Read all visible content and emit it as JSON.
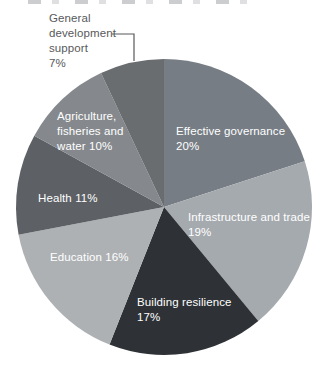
{
  "chart_data": {
    "type": "pie",
    "title": "",
    "legend_position": "none",
    "label_style": "labels inside slices except 'General development support' which sits outside top-left with an elbow leader line",
    "start_angle_deg_from_12_oclock": 0,
    "direction": "clockwise",
    "categories": [
      "Effective governance",
      "Infrastructure and trade",
      "Building resilience",
      "Education",
      "Health",
      "Agriculture, fisheries and water",
      "General development support"
    ],
    "values": [
      20,
      19,
      17,
      16,
      11,
      10,
      7
    ],
    "slices": [
      {
        "key": "effective-governance",
        "label": "Effective governance",
        "value": 20,
        "display": "Effective governance\n20%",
        "color": "#767d84",
        "text_color": "#ffffff"
      },
      {
        "key": "infrastructure-and-trade",
        "label": "Infrastructure and trade",
        "value": 19,
        "display": "Infrastructure and trade\n19%",
        "color": "#a5aaae",
        "text_color": "#ffffff"
      },
      {
        "key": "building-resilience",
        "label": "Building resilience",
        "value": 17,
        "display": "Building resilience\n17%",
        "color": "#2e3236",
        "text_color": "#ffffff"
      },
      {
        "key": "education",
        "label": "Education",
        "value": 16,
        "display": "Education 16%",
        "color": "#aeb1b4",
        "text_color": "#ffffff"
      },
      {
        "key": "health",
        "label": "Health",
        "value": 11,
        "display": "Health 11%",
        "color": "#5d6165",
        "text_color": "#ffffff"
      },
      {
        "key": "agriculture-fisheries-water",
        "label": "Agriculture, fisheries and water",
        "value": 10,
        "display": "Agriculture,\nfisheries and\nwater 10%",
        "color": "#85898d",
        "text_color": "#ffffff"
      },
      {
        "key": "general-development-support",
        "label": "General development support",
        "value": 7,
        "display": "General\ndevelopment\nsupport\n7%",
        "color": "#6a6d70",
        "text_color": "#58595b"
      }
    ],
    "leader_line_color": "#58595b"
  }
}
